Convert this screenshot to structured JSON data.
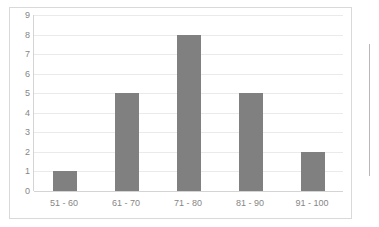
{
  "chart_data": {
    "type": "bar",
    "title": "",
    "subtitle": "",
    "xlabel": "",
    "ylabel": "",
    "categories": [
      "51 - 60",
      "61 - 70",
      "71 - 80",
      "81 - 90",
      "91 - 100"
    ],
    "values": [
      1,
      5,
      8,
      5,
      2
    ],
    "ylim": [
      0,
      9
    ],
    "ytick_step": 1,
    "yticks": [
      0,
      1,
      2,
      3,
      4,
      5,
      6,
      7,
      8,
      9
    ],
    "ytick_labels": [
      "0",
      "1",
      "2",
      "3",
      "4",
      "5",
      "6",
      "7",
      "8",
      "9"
    ],
    "grid": true,
    "grid_axis": "y",
    "legend": false,
    "legend_position": "none",
    "annotations": [],
    "colors": {
      "bar": "#808080",
      "gridline": "#eaeaea",
      "axis": "#d4d4d4",
      "tick_text": "#868686",
      "frame_border": "#d9d9d9",
      "plot_background": "#ffffff"
    }
  }
}
